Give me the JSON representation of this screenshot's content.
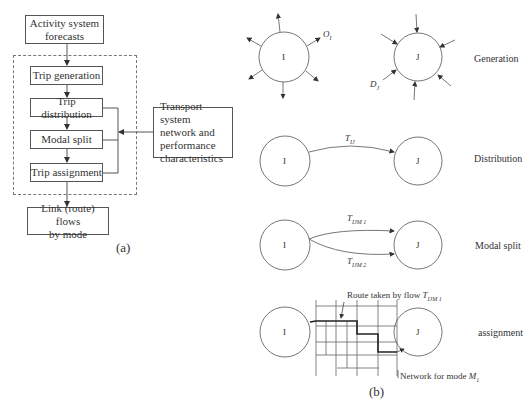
{
  "panel_a": {
    "caption": "(a)",
    "activity_box": [
      "Activity system",
      "forecasts"
    ],
    "steps": [
      "Trip generation",
      "Trip distribution",
      "Modal split",
      "Trip assignment"
    ],
    "transport_box": [
      "Transport system",
      "network and",
      "performance",
      "characteristics"
    ],
    "output_box": [
      "Link (route) flows",
      "by mode"
    ]
  },
  "panel_b": {
    "caption": "(b)",
    "rows": [
      {
        "label": "Generation",
        "origin": "I",
        "destination": "J",
        "origin_flow": "O",
        "origin_sub": "I",
        "dest_flow": "D",
        "dest_sub": "J"
      },
      {
        "label": "Distribution",
        "origin": "I",
        "destination": "J",
        "flow": "T",
        "flow_sub": "IJ"
      },
      {
        "label": "Modal split",
        "origin": "I",
        "destination": "J",
        "flow1": "T",
        "flow1_sub": "IJM 1",
        "flow2": "T",
        "flow2_sub": "IJM 2"
      },
      {
        "label": "assignment",
        "origin": "I",
        "destination": "J",
        "route_note": "Route taken by flow ",
        "route_flow": "T",
        "route_sub": "IJM 1",
        "network_note": "Network for mode ",
        "network_mode": "M",
        "network_sub": "1"
      }
    ]
  }
}
